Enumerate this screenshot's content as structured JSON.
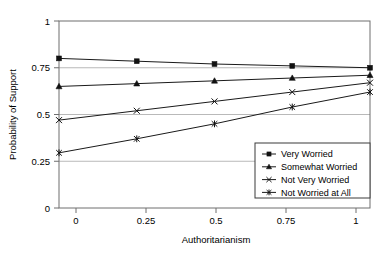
{
  "chart_data": {
    "type": "line",
    "title": "",
    "subtitle": "",
    "xlabel": "Authoritarianism",
    "ylabel": "Probability of Support",
    "x": [
      0,
      0.25,
      0.5,
      0.75,
      1
    ],
    "xticklabels": [
      "0",
      "0.25",
      "0.5",
      "0.75",
      "1"
    ],
    "yticklabels": [
      "0",
      "0.25",
      "0.5",
      "0.75",
      "1"
    ],
    "xlim": [
      0,
      1
    ],
    "ylim": [
      0,
      1
    ],
    "yticks": [
      0,
      0.25,
      0.5,
      0.75,
      1
    ],
    "grid": "horizontal",
    "legend_position": "bottom-right",
    "series": [
      {
        "name": "Very Worried",
        "marker": "filled-square",
        "values": [
          0.8,
          0.785,
          0.77,
          0.76,
          0.75
        ]
      },
      {
        "name": "Somewhat Worried",
        "marker": "filled-triangle",
        "values": [
          0.65,
          0.665,
          0.68,
          0.695,
          0.71
        ]
      },
      {
        "name": "Not Very Worried",
        "marker": "cross-x",
        "values": [
          0.47,
          0.52,
          0.57,
          0.62,
          0.67
        ]
      },
      {
        "name": "Not Worried at All",
        "marker": "asterisk",
        "values": [
          0.295,
          0.37,
          0.45,
          0.54,
          0.62
        ]
      }
    ],
    "colors": {
      "line": "#1a1a1a",
      "marker": "#111111",
      "gridline": "#b9b9b9",
      "frame": "#6e6e6e",
      "background": "#ffffff"
    }
  },
  "legend": {
    "items": [
      {
        "label": "Very Worried"
      },
      {
        "label": "Somewhat Worried"
      },
      {
        "label": "Not Very Worried"
      },
      {
        "label": "Not Worried at All"
      }
    ]
  },
  "axes": {
    "x_title": "Authoritarianism",
    "y_title": "Probability of Support",
    "x_ticks": [
      "0",
      "0.25",
      "0.5",
      "0.75",
      "1"
    ],
    "y_ticks": [
      "0",
      "0.25",
      "0.5",
      "0.75",
      "1"
    ]
  }
}
